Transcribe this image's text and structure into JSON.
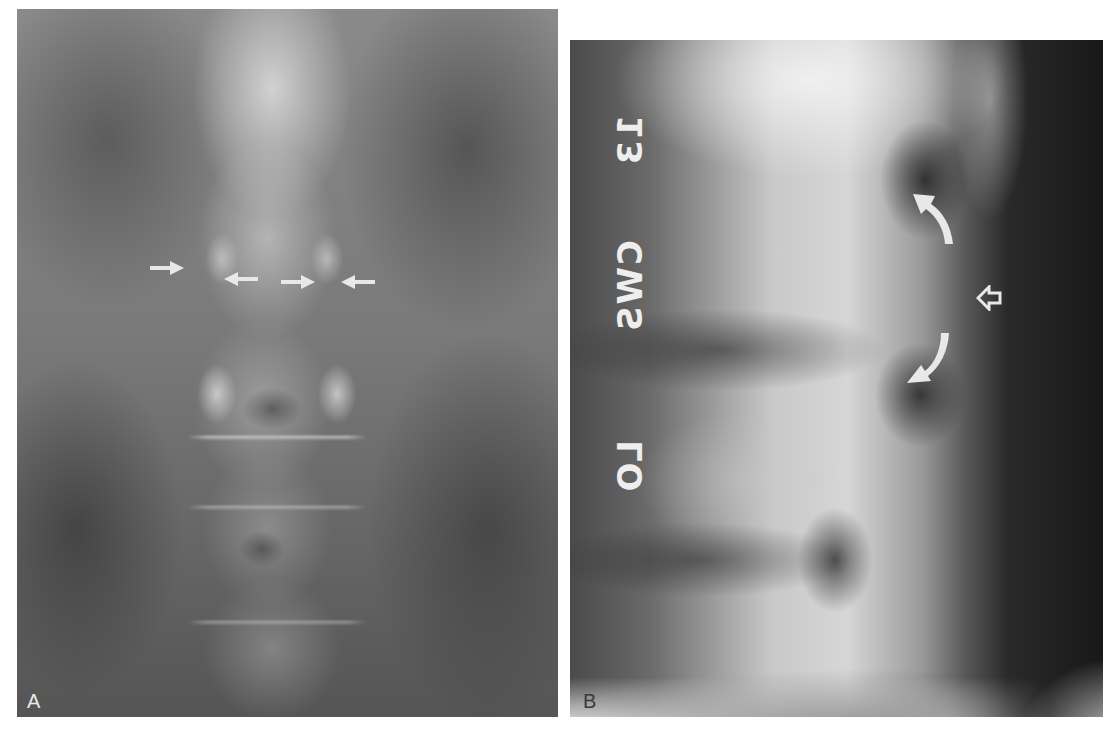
{
  "figure": {
    "panels": [
      {
        "id": "A",
        "label": "A",
        "view": "AP radiograph of the lumbar spine",
        "annotations": {
          "straight_arrows": [
            {
              "direction": "right",
              "x": 167,
              "y": 267
            },
            {
              "direction": "left",
              "x": 238,
              "y": 278
            },
            {
              "direction": "right",
              "x": 295,
              "y": 281
            },
            {
              "direction": "left",
              "x": 355,
              "y": 281
            }
          ]
        }
      },
      {
        "id": "B",
        "label": "B",
        "view": "Lateral radiograph of the lumbar spine",
        "film_marker_text": "L3 CWS LO",
        "film_marker_parts": [
          "13",
          "CWS",
          "LO"
        ],
        "annotations": {
          "curved_arrows": [
            {
              "direction": "up",
              "x": 935,
              "y": 215
            },
            {
              "direction": "down",
              "x": 925,
              "y": 360
            }
          ],
          "open_arrow": {
            "direction": "left",
            "x": 990,
            "y": 296
          }
        }
      }
    ],
    "colors": {
      "background": "#ffffff",
      "arrow_fill": "#e8e8e8",
      "label_a": "#eaeaea",
      "label_b": "#3a3a3a"
    }
  }
}
